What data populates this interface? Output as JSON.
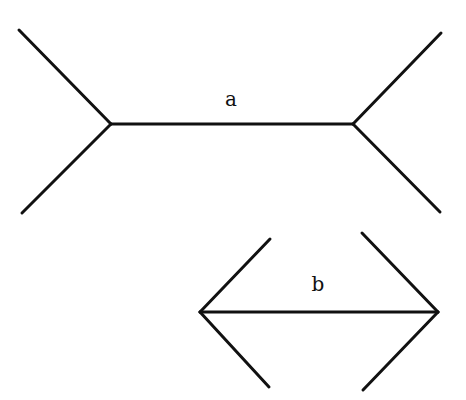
{
  "style": {
    "stroke_color": "#111111",
    "stroke_width": 3,
    "background": "#ffffff"
  },
  "figures": [
    {
      "id": "a",
      "label": "a",
      "label_pos": [
        231,
        99
      ],
      "shaft": {
        "from": [
          111,
          124
        ],
        "to": [
          353,
          124
        ]
      },
      "fins": [
        {
          "from": [
            111,
            124
          ],
          "to": [
            19,
            30
          ]
        },
        {
          "from": [
            111,
            124
          ],
          "to": [
            22,
            213
          ]
        },
        {
          "from": [
            353,
            124
          ],
          "to": [
            441,
            33
          ]
        },
        {
          "from": [
            353,
            124
          ],
          "to": [
            440,
            212
          ]
        }
      ],
      "fin_direction": "outward"
    },
    {
      "id": "b",
      "label": "b",
      "label_pos": [
        318,
        284
      ],
      "shaft": {
        "from": [
          200,
          312
        ],
        "to": [
          438,
          312
        ]
      },
      "fins": [
        {
          "from": [
            200,
            312
          ],
          "to": [
            270,
            239
          ]
        },
        {
          "from": [
            200,
            312
          ],
          "to": [
            269,
            387
          ]
        },
        {
          "from": [
            438,
            312
          ],
          "to": [
            362,
            233
          ]
        },
        {
          "from": [
            438,
            312
          ],
          "to": [
            363,
            390
          ]
        }
      ],
      "fin_direction": "inward"
    }
  ]
}
